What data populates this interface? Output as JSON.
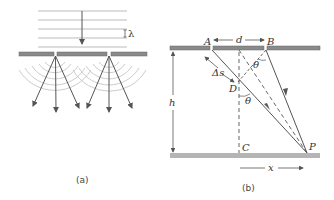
{
  "panel_a": {
    "caption": "(a)",
    "wavelength_label": "λ",
    "description": "Plane waves incident on a barrier with two slits; circular wavefronts spread from each slit"
  },
  "panel_b": {
    "caption": "(b)",
    "labels": {
      "A": "A",
      "B": "B",
      "C": "C",
      "D": "D",
      "P": "P",
      "d": "d",
      "h": "h",
      "x": "x",
      "delta_s": "Δs",
      "theta": "θ"
    },
    "description": "Geometry of two-slit interference: slits A and B separated by d, screen at distance h, point P at distance x from center C"
  },
  "colors": {
    "barrier": "#8a8a8a",
    "lines": "#555555",
    "wavefront": "#bbbbbb",
    "arc": "#cccccc",
    "ground": "#b5b5b5"
  }
}
